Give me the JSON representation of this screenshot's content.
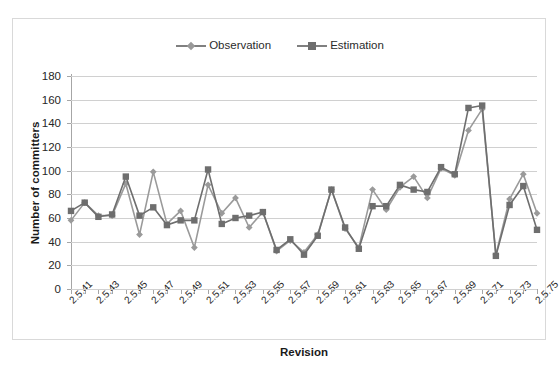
{
  "chart_data": {
    "type": "line",
    "title": "",
    "xlabel": "Revision",
    "ylabel": "Number of committers",
    "ylim": [
      0,
      180
    ],
    "ytick_step": 20,
    "yticks": [
      0,
      20,
      40,
      60,
      80,
      100,
      120,
      140,
      160,
      180
    ],
    "grid": true,
    "legend_position": "top-center",
    "x": [
      "2.5.41",
      "2.5.42",
      "2.5.43",
      "2.5.44",
      "2.5.45",
      "2.5.46",
      "2.5.47",
      "2.5.48",
      "2.5.49",
      "2.5.50",
      "2.5.51",
      "2.5.52",
      "2.5.53",
      "2.5.54",
      "2.5.55",
      "2.5.56",
      "2.5.57",
      "2.5.58",
      "2.5.59",
      "2.5.60",
      "2.5.61",
      "2.5.62",
      "2.5.63",
      "2.5.64",
      "2.5.65",
      "2.5.66",
      "2.5.67",
      "2.5.68",
      "2.5.69",
      "2.5.70",
      "2.5.71",
      "2.5.72",
      "2.5.73",
      "2.5.74",
      "2.5.75"
    ],
    "xtick_labels": [
      "2.5.41",
      "2.5.43",
      "2.5.45",
      "2.5.47",
      "2.5.49",
      "2.5.51",
      "2.5.53",
      "2.5.55",
      "2.5.57",
      "2.5.59",
      "2.5.61",
      "2.5.63",
      "2.5.65",
      "2.5.67",
      "2.5.69",
      "2.5.71",
      "2.5.73",
      "2.5.75"
    ],
    "series": [
      {
        "name": "Observation",
        "marker": "diamond",
        "color": "#9a9a9a",
        "values": [
          58,
          73,
          62,
          62,
          89,
          46,
          99,
          55,
          66,
          35,
          88,
          64,
          77,
          52,
          65,
          32,
          41,
          31,
          46,
          84,
          51,
          35,
          84,
          67,
          86,
          95,
          77,
          102,
          96,
          134,
          152,
          29,
          76,
          97,
          64
        ]
      },
      {
        "name": "Estimation",
        "marker": "square",
        "color": "#6e6e6e",
        "values": [
          66,
          73,
          61,
          63,
          95,
          62,
          69,
          54,
          58,
          58,
          101,
          55,
          60,
          62,
          65,
          33,
          42,
          29,
          45,
          84,
          52,
          34,
          70,
          70,
          88,
          84,
          82,
          103,
          97,
          153,
          155,
          28,
          71,
          87,
          50
        ]
      }
    ]
  },
  "legend": {
    "items": [
      {
        "label": "Observation",
        "marker": "diamond"
      },
      {
        "label": "Estimation",
        "marker": "square"
      }
    ]
  },
  "colors": {
    "observation": "#9a9a9a",
    "estimation": "#6e6e6e",
    "grid": "#d0d0d0",
    "axis": "#a6a6a6",
    "frame": "#d9d9d9",
    "text": "#262626"
  }
}
